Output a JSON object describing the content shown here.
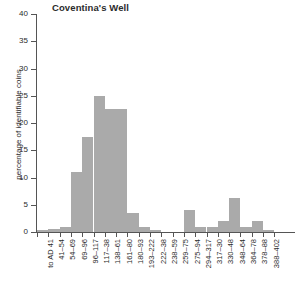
{
  "chart_data": {
    "type": "bar",
    "title": "Coventina's Well",
    "xlabel": "",
    "ylabel": "percentage of identifiable coins",
    "ylim": [
      0,
      40
    ],
    "ytick_step": 5,
    "yticks": [
      0,
      5,
      10,
      15,
      20,
      25,
      30,
      35,
      40
    ],
    "grid": false,
    "legend": null,
    "bar_color": "#aaaaaa",
    "categories": [
      "to AD 41",
      "41–54",
      "54–69",
      "69–96",
      "96–117",
      "117–38",
      "138–61",
      "161–80",
      "180–93",
      "193–222",
      "222–38",
      "238–59",
      "259–75",
      "275–94",
      "294–317",
      "317–30",
      "330–48",
      "348–64",
      "364–78",
      "378–88",
      "388–402"
    ],
    "values": [
      0.4,
      0.5,
      1.0,
      11.0,
      17.5,
      25.0,
      22.5,
      22.5,
      3.5,
      1.0,
      0.4,
      0,
      0,
      4.0,
      1.0,
      1.0,
      2.0,
      6.3,
      1.0,
      2.0,
      0.4
    ]
  }
}
